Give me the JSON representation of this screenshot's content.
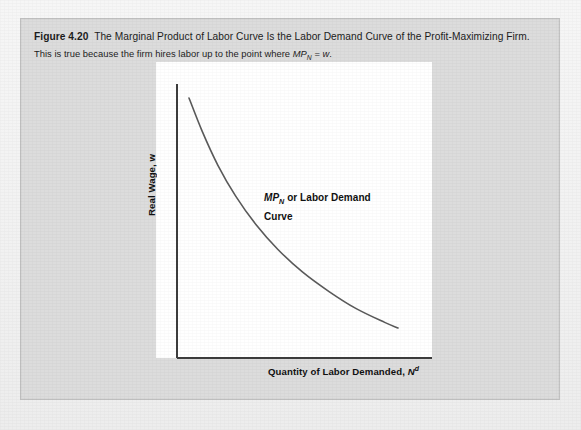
{
  "figure": {
    "number_label": "Figure 4.20",
    "title": "The Marginal Product of Labor Curve Is the Labor Demand Curve of the Profit-Maximizing Firm.",
    "subtitle_pre": "This is true because the firm hires labor up to the point where ",
    "subtitle_math_base": "MP",
    "subtitle_math_sub": "N",
    "subtitle_math_rel": " = ",
    "subtitle_math_var": "w",
    "subtitle_post": "."
  },
  "axes": {
    "y_label": "Real Wage, w",
    "x_label_pre": "Quantity of Labor Demanded, ",
    "x_label_var": "N",
    "x_label_sup": "d"
  },
  "annotation": {
    "math_base": "MP",
    "math_sub": "N",
    "text_rest": " or Labor Demand",
    "line2": "Curve"
  },
  "colors": {
    "panel_background": "#dcdcdc",
    "panel_border": "#c2c2c2",
    "plot_background": "#ffffff",
    "axis_line": "#3d3d3d",
    "curve_stroke": "#5a5a5a",
    "text": "#1c1c1c",
    "page_background": "#f2f2f2"
  },
  "chart_data": {
    "type": "line",
    "title": "The Marginal Product of Labor Curve Is the Labor Demand Curve of the Profit-Maximizing Firm.",
    "xlabel": "Quantity of Labor Demanded, N^d",
    "ylabel": "Real Wage, w",
    "grid": false,
    "legend": "none",
    "xlim": [
      0,
      1
    ],
    "ylim": [
      0,
      1
    ],
    "xtick_labels": [],
    "ytick_labels": [],
    "annotations": [
      {
        "text": "MP_N or Labor Demand Curve",
        "x": 0.42,
        "y": 0.62
      }
    ],
    "series": [
      {
        "name": "MP_N or Labor Demand Curve",
        "shape": "convex-decreasing",
        "x": [
          0.06,
          0.12,
          0.19,
          0.27,
          0.36,
          0.46,
          0.57,
          0.69,
          0.81,
          0.94,
          1.0
        ],
        "y": [
          0.96,
          0.84,
          0.72,
          0.61,
          0.51,
          0.42,
          0.34,
          0.27,
          0.21,
          0.16,
          0.14
        ]
      }
    ]
  }
}
